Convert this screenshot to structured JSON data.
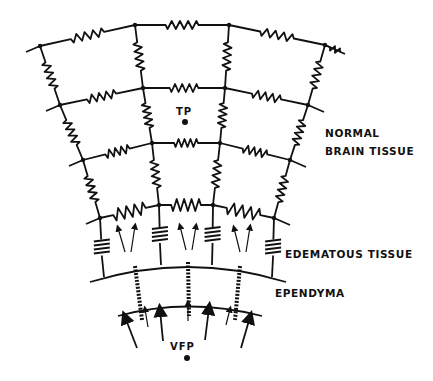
{
  "labels": {
    "normal_line1": "NORMAL",
    "normal_line2": "BRAIN TISSUE",
    "edematous": "EDEMATOUS TISSUE",
    "ependyma": "EPENDYMA",
    "tissue_point": "TP",
    "ventricular_fluid_point": "VFP"
  },
  "colors": {
    "ink": "#111111",
    "background": "#ffffff"
  },
  "diagram": {
    "type": "resistor-capacitor network model of brain tissue",
    "grid_rows": 4,
    "grid_columns": 4,
    "edematous_capacitor_count": 4,
    "ependymal_channels": 3
  }
}
